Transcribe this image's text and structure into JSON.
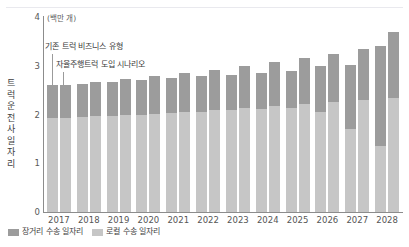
{
  "chart_data": {
    "type": "bar",
    "title": "",
    "subtitle": "",
    "unit_label": "(백만 개)",
    "xlabel": "",
    "ylabel": "트럭 운전사 일자리",
    "ylim": [
      0,
      4
    ],
    "yticks": [
      0,
      1,
      2,
      3,
      4
    ],
    "ytick_labels": [
      "0",
      "1",
      "2",
      "3",
      "4"
    ],
    "grid": false,
    "legend_position": "bottom-left",
    "stacked": true,
    "grouped": true,
    "group_labels": [
      "기존 트럭 비즈니스 유형",
      "자율주행트럭 도입 시나리오"
    ],
    "categories": [
      "2017",
      "2018",
      "2019",
      "2020",
      "2021",
      "2022",
      "2023",
      "2024",
      "2025",
      "2026",
      "2027",
      "2028"
    ],
    "segment_names": [
      "장거리 수송 일자리",
      "로컬 수송 일자리"
    ],
    "segment_colors": [
      "#9c9c9c",
      "#c6c6c6"
    ],
    "groups": [
      {
        "name": "자율주행트럭 도입 시나리오",
        "position": "left",
        "series": [
          {
            "name": "로컬 수송 일자리",
            "values": [
              1.93,
              1.95,
              1.97,
              2.0,
              2.03,
              2.06,
              2.09,
              2.12,
              2.14,
              2.05,
              1.7,
              1.35
            ]
          },
          {
            "name": "장거리 수송 일자리",
            "values": [
              0.67,
              0.68,
              0.69,
              0.7,
              0.71,
              0.72,
              0.73,
              0.74,
              0.76,
              0.95,
              1.32,
              2.05
            ]
          }
        ],
        "totals": [
          2.6,
          2.63,
          2.66,
          2.7,
          2.74,
          2.78,
          2.82,
          2.86,
          2.9,
          3.0,
          3.02,
          3.4
        ]
      },
      {
        "name": "기존 트럭 비즈니스 유형",
        "position": "right",
        "series": [
          {
            "name": "로컬 수송 일자리",
            "values": [
              1.93,
              1.96,
              1.99,
              2.02,
              2.06,
              2.1,
              2.14,
              2.18,
              2.22,
              2.26,
              2.3,
              2.34
            ]
          },
          {
            "name": "장거리 수송 일자리",
            "values": [
              0.67,
              0.7,
              0.73,
              0.76,
              0.79,
              0.82,
              0.86,
              0.9,
              0.94,
              0.98,
              1.04,
              1.36
            ]
          }
        ],
        "totals": [
          2.6,
          2.66,
          2.72,
          2.78,
          2.85,
          2.92,
          3.0,
          3.08,
          3.16,
          3.24,
          3.34,
          3.7
        ]
      }
    ],
    "annotations": [
      {
        "text": "기존 트럭 비즈니스 유형",
        "target": "2017-right-bar"
      },
      {
        "text": "자율주행트럭 도입 시나리오",
        "target": "2018-left-bar"
      }
    ],
    "legend": [
      {
        "label": "장거리 수송 일자리",
        "color": "#9c9c9c"
      },
      {
        "label": "로컬 수송 일자리",
        "color": "#c6c6c6"
      }
    ]
  }
}
